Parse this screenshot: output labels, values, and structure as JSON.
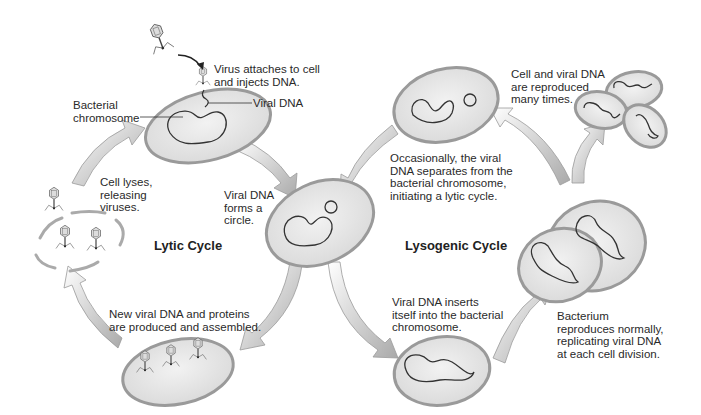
{
  "diagram": {
    "cycles": [
      {
        "id": "lytic",
        "title": "Lytic Cycle"
      },
      {
        "id": "lysogenic",
        "title": "Lysogenic Cycle"
      }
    ],
    "labels": {
      "virus_attaches": "Virus attaches to cell\nand injects DNA.",
      "viral_dna": "Viral DNA",
      "bacterial_chromosome": "Bacterial\nchromosome",
      "cell_lyses": "Cell lyses,\nreleasing\nviruses.",
      "forms_circle": "Viral DNA\nforms a\ncircle.",
      "new_viral_dna": "New viral DNA and proteins\nare produced and assembled.",
      "occasionally": "Occasionally, the viral\nDNA separates from the\nbacterial chromosome,\ninitiating a lytic cycle.",
      "reproduced": "Cell and viral DNA\nare reproduced\nmany times.",
      "inserts": "Viral DNA inserts\nitself into the bacterial\nchromosome.",
      "bacterium_reproduces": "Bacterium\nreproduces normally,\nreplicating viral DNA\nat each cell division."
    },
    "colors": {
      "cell_fill": "#e4e4e4",
      "cell_border": "#9a9a9a",
      "arrow": "#b8b8b8",
      "dna": "#333333"
    }
  }
}
